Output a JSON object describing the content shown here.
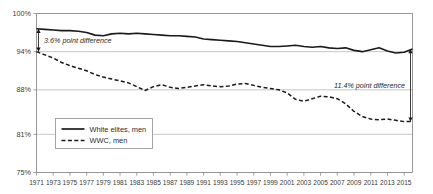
{
  "chart_data": {
    "type": "line",
    "title": "",
    "subtitle": "",
    "xlabel": "",
    "ylabel": "",
    "grid": true,
    "legend_position": "inside-bottom-left",
    "xlim": [
      1971,
      2016
    ],
    "ylim": [
      75,
      100
    ],
    "ytick_labels": [
      "100%",
      "94%",
      "88%",
      "81%",
      "75%"
    ],
    "ytick_values": [
      100,
      94,
      88,
      81,
      75
    ],
    "x": [
      1971,
      1972,
      1973,
      1974,
      1975,
      1976,
      1977,
      1978,
      1979,
      1980,
      1981,
      1982,
      1983,
      1984,
      1985,
      1986,
      1987,
      1988,
      1989,
      1990,
      1991,
      1992,
      1993,
      1994,
      1995,
      1996,
      1997,
      1998,
      1999,
      2000,
      2001,
      2002,
      2003,
      2004,
      2005,
      2006,
      2007,
      2008,
      2009,
      2010,
      2011,
      2012,
      2013,
      2014,
      2015,
      2016
    ],
    "xtick_labels": [
      "1971",
      "1973",
      "1975",
      "1977",
      "1979",
      "1981",
      "1983",
      "1985",
      "1987",
      "1989",
      "1991",
      "1993",
      "1995",
      "1997",
      "1999",
      "2001",
      "2003",
      "2005",
      "2007",
      "2009",
      "2011",
      "2013",
      "2015"
    ],
    "xtick_values": [
      1971,
      1973,
      1975,
      1977,
      1979,
      1981,
      1983,
      1985,
      1987,
      1989,
      1991,
      1993,
      1995,
      1997,
      1999,
      2001,
      2003,
      2005,
      2007,
      2009,
      2011,
      2013,
      2015
    ],
    "series": [
      {
        "name": "White elites, men",
        "style": "solid",
        "color": "#1a1a1a",
        "values": [
          97.6,
          97.5,
          97.4,
          97.3,
          97.3,
          97.2,
          97.0,
          96.6,
          96.5,
          96.8,
          96.9,
          96.8,
          96.9,
          96.8,
          96.7,
          96.6,
          96.5,
          96.5,
          96.4,
          96.3,
          96.0,
          95.9,
          95.8,
          95.7,
          95.6,
          95.4,
          95.2,
          95.0,
          94.8,
          94.8,
          94.9,
          95.0,
          94.8,
          94.7,
          94.8,
          94.6,
          94.5,
          94.6,
          94.2,
          94.0,
          94.3,
          94.6,
          94.1,
          93.8,
          93.9,
          94.4
        ]
      },
      {
        "name": "WWC, men",
        "style": "dashed",
        "color": "#1a1a1a",
        "values": [
          94.0,
          93.5,
          93.0,
          92.3,
          91.8,
          91.4,
          91.0,
          90.4,
          90.0,
          89.7,
          89.4,
          89.1,
          88.5,
          87.9,
          88.5,
          88.8,
          88.4,
          88.2,
          88.4,
          88.6,
          88.8,
          88.6,
          88.5,
          88.6,
          88.9,
          89.0,
          88.7,
          88.4,
          88.2,
          88.0,
          87.5,
          86.5,
          86.2,
          86.6,
          87.0,
          86.9,
          86.6,
          85.8,
          84.6,
          83.8,
          83.4,
          83.3,
          83.4,
          83.2,
          83.0,
          83.0
        ]
      }
    ],
    "annotations": [
      {
        "name": "left-gap-annotation",
        "label": "3.6% point difference",
        "x": 1971,
        "y_top": 97.6,
        "y_bottom": 94.0,
        "value": 3.6
      },
      {
        "name": "right-gap-annotation",
        "label": "11.4% point difference",
        "x": 2016,
        "y_top": 94.4,
        "y_bottom": 83.0,
        "value": 11.4
      }
    ]
  },
  "legend": {
    "items": [
      {
        "label": "White elites, men",
        "style": "solid"
      },
      {
        "label": "WWC, men",
        "style": "dashed"
      }
    ]
  },
  "colors": {
    "line": "#1a1a1a",
    "grid": "#b8b8b8",
    "axis": "#8a8a8a",
    "text": "#2b2b2b",
    "background": "#ffffff"
  }
}
